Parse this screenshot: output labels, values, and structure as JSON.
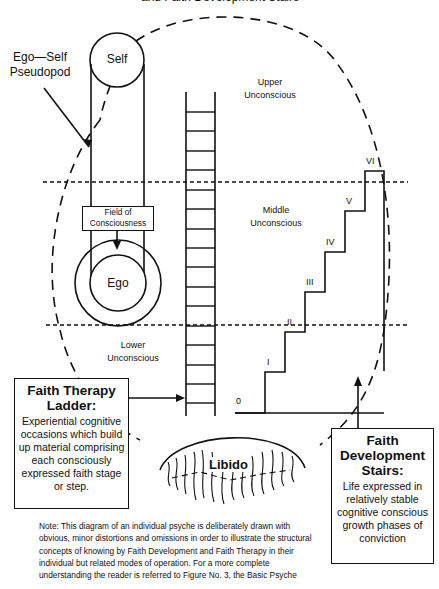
{
  "title_fragment": "and Faith Development Stairs",
  "labels": {
    "ego_self_pseudopod_line1": "Ego—Self",
    "ego_self_pseudopod_line2": "Pseudopod",
    "self": "Self",
    "field_of_consciousness_line1": "Field of",
    "field_of_consciousness_line2": "Consciousness",
    "ego": "Ego",
    "upper_unconscious_line1": "Upper",
    "upper_unconscious_line2": "Unconscious",
    "middle_unconscious_line1": "Middle",
    "middle_unconscious_line2": "Unconscious",
    "lower_unconscious_line1": "Lower",
    "lower_unconscious_line2": "Unconscious",
    "libido": "Libido"
  },
  "stairs": {
    "steps": [
      "0",
      "I",
      "II",
      "III",
      "IV",
      "V",
      "VI"
    ]
  },
  "faith_therapy_box": {
    "heading_line1": "Faith Therapy",
    "heading_line2": "Ladder:",
    "body": "Experiential cognitive occasions which build up material comprising each consciously expressed faith stage or step."
  },
  "faith_development_box": {
    "heading_line1": "Faith",
    "heading_line2": "Development",
    "heading_line3": "Stairs:",
    "body": "Life expressed in relatively stable cognitive conscious growth phases of conviction"
  },
  "note": "Note: This diagram of an individual psyche is deliberately drawn with obvious, minor distortions and omissions in order to illustrate the structural concepts of knowing by Faith Development and Faith Therapy in their individual but related modes of operation. For a more complete understanding the reader is referred to Figure No. 3, the Basic Psyche",
  "colors": {
    "ink": "#111111",
    "background": "#ffffff"
  }
}
